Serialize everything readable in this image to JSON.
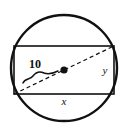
{
  "figure": {
    "name": "circle-with-inscribed-rectangle",
    "background_color": "#ffffff",
    "stroke_color": "#111111",
    "labels": {
      "radius_label": "10",
      "height_label": "y",
      "width_label": "x"
    },
    "shapes": {
      "circle": {
        "name": "outer-circle",
        "center_x": 64,
        "center_y": 68,
        "radius": 53,
        "stroke_width": 2.4
      },
      "rectangle": {
        "name": "inscribed-rectangle",
        "left": 14,
        "top": 46,
        "right": 114,
        "bottom": 94,
        "stroke_width": 1.6
      },
      "diagonal": {
        "name": "rectangle-diagonal-diameter",
        "x1": 14,
        "y1": 94,
        "x2": 114,
        "y2": 46,
        "dash_pattern": "4 3",
        "stroke_width": 1.2
      },
      "center_point": {
        "name": "circle-center-dot",
        "cx": 64,
        "cy": 70,
        "r": 3.6
      },
      "radius_brace": {
        "name": "radius-measure-brace",
        "path": "M 23 83 C 25 78 30 80 33 76 C 36 72 40 71 44 73 C 49 75 54 73 58 71"
      }
    },
    "label_positions": {
      "radius": {
        "x": 35,
        "y": 68
      },
      "height": {
        "x": 105,
        "y": 74
      },
      "width": {
        "x": 64,
        "y": 105
      }
    }
  },
  "chart_data": {
    "type": "diagram",
    "annotations": [
      {
        "label": "10",
        "meaning": "radius of circle",
        "style": "bold"
      },
      {
        "label": "x",
        "meaning": "rectangle width (horizontal side)",
        "style": "italic"
      },
      {
        "label": "y",
        "meaning": "rectangle height (vertical side)",
        "style": "italic"
      }
    ],
    "elements": [
      "circle",
      "inscribed rectangle",
      "dashed diagonal diameter",
      "center point",
      "radius brace"
    ]
  }
}
